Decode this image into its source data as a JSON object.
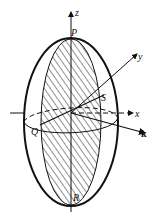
{
  "diagram": {
    "type": "ellipsoid-cross-section",
    "labels": {
      "z_axis": "z",
      "y_axis": "y",
      "x_axis": "x",
      "k_vector": "k",
      "point_top": "P",
      "point_bottom": "R",
      "point_left": "Q",
      "point_right": "S"
    },
    "colors": {
      "stroke": "#111111",
      "background": "#ffffff"
    }
  }
}
